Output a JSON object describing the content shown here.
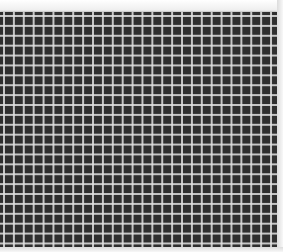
{
  "image": {
    "description": "Close-up of a dark square mesh grid with light gray grid lines",
    "background_color": "#f4f4f4",
    "grid": {
      "cell_color": "#2f2f2f",
      "line_color": "#e1e1e1",
      "approx_cell_pitch_px": 10,
      "approx_columns": 28,
      "approx_rows": 24
    }
  }
}
